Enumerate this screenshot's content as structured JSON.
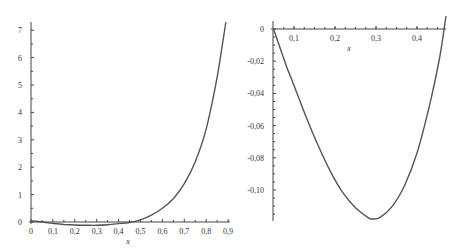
{
  "chart_data": [
    {
      "type": "line",
      "title": "",
      "xlabel": "x",
      "ylabel": "",
      "xlim": [
        0,
        0.9
      ],
      "ylim": [
        -0.12,
        7.3
      ],
      "grid": false,
      "xticks": [
        "0",
        "0,1",
        "0,2",
        "0,3",
        "0,4",
        "0,5",
        "0,6",
        "0,7",
        "0,8",
        "0,9"
      ],
      "yticks": [
        "0",
        "1",
        "2",
        "3",
        "4",
        "5",
        "6",
        "7"
      ],
      "series": [
        {
          "name": "f(x)",
          "x": [
            0,
            0.05,
            0.1,
            0.15,
            0.2,
            0.25,
            0.3,
            0.35,
            0.4,
            0.45,
            0.5,
            0.55,
            0.6,
            0.65,
            0.7,
            0.75,
            0.8,
            0.85,
            0.89
          ],
          "y": [
            0.05,
            0.0,
            -0.05,
            -0.09,
            -0.11,
            -0.12,
            -0.12,
            -0.1,
            -0.06,
            -0.02,
            0.08,
            0.25,
            0.5,
            0.85,
            1.4,
            2.2,
            3.4,
            5.3,
            7.3
          ]
        }
      ]
    },
    {
      "type": "line",
      "title": "",
      "xlabel": "x",
      "ylabel": "",
      "xlim": [
        0.05,
        0.47
      ],
      "ylim": [
        -0.118,
        0
      ],
      "grid": false,
      "xticks": [
        "0,1",
        "0,2",
        "0,3",
        "0,4"
      ],
      "yticks": [
        "0",
        "-0,02",
        "-0,04",
        "-0,06",
        "-0,08",
        "-0,10"
      ],
      "series": [
        {
          "name": "f(x)",
          "x": [
            0.05,
            0.08,
            0.1,
            0.13,
            0.16,
            0.19,
            0.22,
            0.25,
            0.28,
            0.29,
            0.31,
            0.34,
            0.37,
            0.4,
            0.43,
            0.455,
            0.47
          ],
          "y": [
            0.0,
            -0.022,
            -0.035,
            -0.055,
            -0.073,
            -0.089,
            -0.102,
            -0.111,
            -0.117,
            -0.118,
            -0.117,
            -0.11,
            -0.097,
            -0.077,
            -0.048,
            -0.018,
            0.003
          ]
        }
      ]
    }
  ],
  "left_plot": {
    "xlabel": "x",
    "xticks": [
      "0",
      "0,1",
      "0,2",
      "0,3",
      "0,4",
      "0,5",
      "0,6",
      "0,7",
      "0,8",
      "0,9"
    ],
    "yticks": [
      "0",
      "1",
      "2",
      "3",
      "4",
      "5",
      "6",
      "7"
    ]
  },
  "right_plot": {
    "xlabel": "x",
    "xticks": [
      "0,1",
      "0,2",
      "0,3",
      "0,4"
    ],
    "yticks": [
      "0",
      "-0,02",
      "-0,04",
      "-0,06",
      "-0,08",
      "-0,10"
    ]
  }
}
